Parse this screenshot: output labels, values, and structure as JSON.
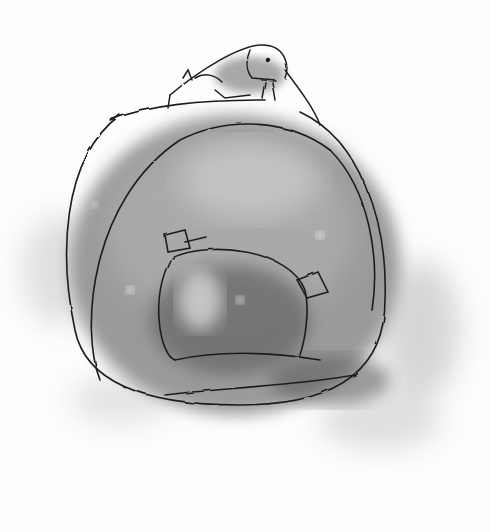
{
  "image": {
    "kind": "charcoal sketch",
    "palette": {
      "paper": "#fdfdfd",
      "smudge_light": "#bdbdbd",
      "smudge_mid": "#8f8f8f",
      "smudge_dark": "#5a5a5a",
      "line": "#1e1e1e"
    },
    "subjects": [
      {
        "name": "insect",
        "description": "a small grasshopper-like insect perched on top of the round form"
      },
      {
        "name": "round-form",
        "description": "a large rounded smudged shape drawn in charcoal, with an inner rounded shape and two small tag-like squares"
      }
    ]
  }
}
